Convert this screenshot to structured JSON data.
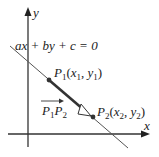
{
  "diagram": {
    "axes": {
      "x_label": "x",
      "y_label": "y"
    },
    "line": {
      "equation": "ax + by + c = 0"
    },
    "points": [
      {
        "name": "P",
        "index": "1",
        "coord_x": "x",
        "coord_x_sub": "1",
        "coord_y": "y",
        "coord_y_sub": "1"
      },
      {
        "name": "P",
        "index": "2",
        "coord_x": "x",
        "coord_x_sub": "2",
        "coord_y": "y",
        "coord_y_sub": "2"
      }
    ],
    "vector": {
      "label_a": "P",
      "label_a_sub": "1",
      "label_b": "P",
      "label_b_sub": "2"
    },
    "colors": {
      "ink": "#222222",
      "line": "#444444",
      "background": "#ffffff"
    }
  }
}
